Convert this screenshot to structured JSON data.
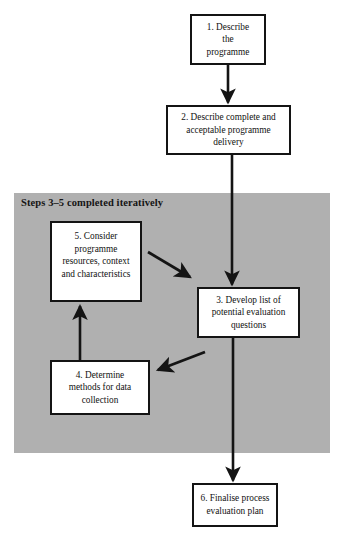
{
  "diagram": {
    "background_color": "#ffffff",
    "grey_region": {
      "label": "Steps 3–5 completed iteratively",
      "color": "#b0b0b0"
    },
    "box_border_color": "#141414",
    "box_fill_color": "#ffffff",
    "arrow_color": "#141414",
    "nodes": [
      {
        "id": "1",
        "text": "1. Describe\nthe\nprogramme"
      },
      {
        "id": "2",
        "text": "2. Describe complete and\nacceptable programme\ndelivery"
      },
      {
        "id": "5",
        "text": "5. Consider\nprogramme\nresources, context\nand characteristics"
      },
      {
        "id": "3",
        "text": "3. Develop list of\npotential evaluation\nquestions"
      },
      {
        "id": "4",
        "text": "4. Determine\nmethods for data\ncollection"
      },
      {
        "id": "6",
        "text": "6. Finalise process\nevaluation plan"
      }
    ],
    "connectors": [
      {
        "name": "arrow-1-to-2",
        "from": "1",
        "to": "2",
        "style": "vertical-down"
      },
      {
        "name": "arrow-2-to-3",
        "from": "2",
        "to": "3",
        "style": "vertical-down"
      },
      {
        "name": "arrow-5-to-3",
        "from": "5",
        "to": "3",
        "style": "diagonal-down-right"
      },
      {
        "name": "arrow-3-to-4",
        "from": "3",
        "to": "4",
        "style": "diagonal-down-left"
      },
      {
        "name": "arrow-4-to-5",
        "from": "4",
        "to": "5",
        "style": "vertical-up"
      },
      {
        "name": "arrow-3-to-6",
        "from": "3",
        "to": "6",
        "style": "vertical-down"
      }
    ]
  }
}
